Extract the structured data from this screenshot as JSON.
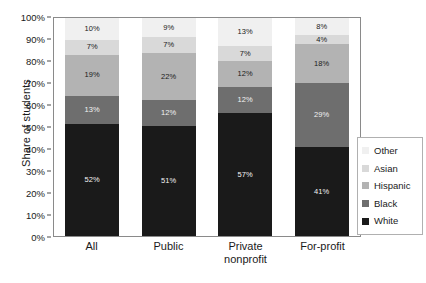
{
  "chart_data": {
    "type": "bar",
    "subtype": "stacked-bar-100",
    "title": "",
    "xlabel": "",
    "ylabel": "Share of students",
    "ylim": [
      0,
      100
    ],
    "ytick_labels": [
      "100%",
      "90%",
      "80%",
      "70%",
      "60%",
      "50%",
      "40%",
      "30%",
      "20%",
      "10%",
      "0%"
    ],
    "ytick_values": [
      100,
      90,
      80,
      70,
      60,
      50,
      40,
      30,
      20,
      10,
      0
    ],
    "grid": false,
    "legend_position": "right",
    "categories": [
      "All",
      "Public",
      "Private nonprofit",
      "For-profit"
    ],
    "category_lines": [
      [
        "All"
      ],
      [
        "Public"
      ],
      [
        "Private",
        "nonprofit"
      ],
      [
        "For-profit"
      ]
    ],
    "series": [
      {
        "name": "White",
        "color": "#1a1a1a",
        "label_color": "light",
        "values": [
          52,
          51,
          57,
          41
        ],
        "labels": [
          "52%",
          "51%",
          "57%",
          "41%"
        ]
      },
      {
        "name": "Black",
        "color": "#6e6e6e",
        "label_color": "light",
        "values": [
          13,
          12,
          12,
          29
        ],
        "labels": [
          "13%",
          "12%",
          "12%",
          "29%"
        ]
      },
      {
        "name": "Hispanic",
        "color": "#b3b3b3",
        "label_color": "dark",
        "values": [
          19,
          22,
          12,
          18
        ],
        "labels": [
          "19%",
          "22%",
          "12%",
          "18%"
        ]
      },
      {
        "name": "Asian",
        "color": "#d9d9d9",
        "label_color": "dark",
        "values": [
          7,
          7,
          7,
          4
        ],
        "labels": [
          "7%",
          "7%",
          "7%",
          "4%"
        ]
      },
      {
        "name": "Other",
        "color": "#f0f0f0",
        "label_color": "dark",
        "values": [
          10,
          9,
          13,
          8
        ],
        "labels": [
          "10%",
          "9%",
          "13%",
          "8%"
        ]
      }
    ],
    "legend_entries": [
      {
        "label": "Other",
        "color": "#f0f0f0"
      },
      {
        "label": "Asian",
        "color": "#d9d9d9"
      },
      {
        "label": "Hispanic",
        "color": "#b3b3b3"
      },
      {
        "label": "Black",
        "color": "#6e6e6e"
      },
      {
        "label": "White",
        "color": "#1a1a1a"
      }
    ]
  }
}
